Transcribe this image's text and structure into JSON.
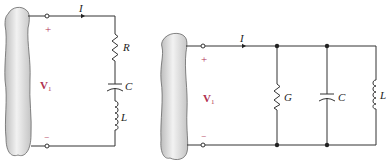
{
  "figure": {
    "colors": {
      "wire": "#333333",
      "label": "#222222",
      "accent_label": "#b03050",
      "source_blob": "#d8d8d8"
    },
    "series_circuit": {
      "current_label": "I",
      "plus_label": "+",
      "minus_label": "−",
      "voltage_label": "V",
      "voltage_subscript": "1",
      "components": [
        {
          "symbol": "resistor",
          "label": "R"
        },
        {
          "symbol": "capacitor",
          "label": "C"
        },
        {
          "symbol": "inductor",
          "label": "L"
        }
      ]
    },
    "parallel_circuit": {
      "current_label": "I",
      "plus_label": "+",
      "minus_label": "−",
      "voltage_label": "V",
      "voltage_subscript": "1",
      "components": [
        {
          "symbol": "resistor",
          "label": "G"
        },
        {
          "symbol": "capacitor",
          "label": "C"
        },
        {
          "symbol": "inductor",
          "label": "L"
        }
      ]
    }
  }
}
